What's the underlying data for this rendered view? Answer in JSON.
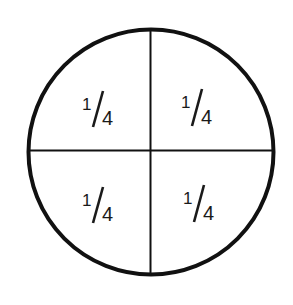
{
  "diagram": {
    "type": "fraction-circle",
    "stroke_color": "#111111",
    "background": "#ffffff",
    "quadrants": [
      {
        "position": "top-left",
        "numerator": "1",
        "denominator": "4"
      },
      {
        "position": "top-right",
        "numerator": "1",
        "denominator": "4"
      },
      {
        "position": "bottom-left",
        "numerator": "1",
        "denominator": "4"
      },
      {
        "position": "bottom-right",
        "numerator": "1",
        "denominator": "4"
      }
    ]
  }
}
